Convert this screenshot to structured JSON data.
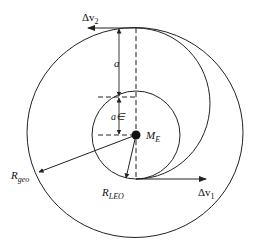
{
  "diagram": {
    "type": "hohmann-transfer-orbit",
    "labels": {
      "dv2": "Δv",
      "dv2_sub": "2",
      "dv1": "Δv",
      "dv1_sub": "1",
      "a": "a",
      "ae": "a∈",
      "earth": "M",
      "earth_sub": "E",
      "r_geo": "R",
      "r_geo_sub": "geo",
      "r_leo": "R",
      "r_leo_sub": "LEO"
    },
    "colors": {
      "stroke": "#222222",
      "background": "#ffffff",
      "earth": "#111111"
    }
  }
}
